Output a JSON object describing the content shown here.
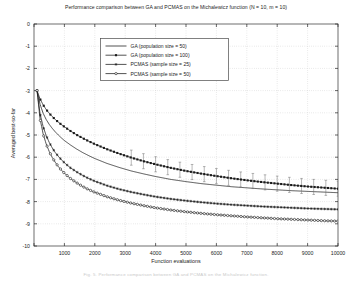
{
  "figure": {
    "title": "Performance comparison between GA and PCMAS on the Michalewicz function (N = 10, m = 10)",
    "xlabel": "Function evaluations",
    "ylabel": "Averaged best-so-far",
    "caption_artifact": "Fig. 5.  Performance comparison between GA and PCMAS on the Michalewicz function."
  },
  "chart_data": {
    "type": "line",
    "title": "Performance comparison between GA and PCMAS on the Michalewicz function (N = 10, m = 10)",
    "xlabel": "Function evaluations",
    "ylabel": "Averaged best-so-far",
    "xlim": [
      0,
      10000
    ],
    "ylim": [
      -10,
      0
    ],
    "xticks": [
      0,
      1000,
      2000,
      3000,
      4000,
      5000,
      6000,
      7000,
      8000,
      9000,
      10000
    ],
    "xticklabels": [
      "",
      "1000",
      "2000",
      "3000",
      "4000",
      "5000",
      "6000",
      "7000",
      "8000",
      "9000",
      "10000"
    ],
    "yticks": [
      0,
      -1,
      -2,
      -3,
      -4,
      -5,
      -6,
      -7,
      -8,
      -9,
      -10
    ],
    "yticklabels": [
      "0",
      "-1",
      "-2",
      "-3",
      "-4",
      "-5",
      "-6",
      "-7",
      "-8",
      "-9",
      "-10"
    ],
    "grid": true,
    "legend_position": "upper-center-left",
    "series": [
      {
        "name": "GA (population size = 50)",
        "marker": "none",
        "color": "#1a1a1a",
        "x": [
          100,
          200,
          300,
          400,
          500,
          600,
          700,
          800,
          900,
          1000,
          1200,
          1400,
          1600,
          1800,
          2000,
          2400,
          2800,
          3200,
          3600,
          4000,
          4500,
          5000,
          5500,
          6000,
          6500,
          7000,
          7500,
          8000,
          8500,
          9000,
          9500,
          10000
        ],
        "values": [
          -3.0,
          -3.62,
          -4.02,
          -4.3,
          -4.52,
          -4.7,
          -4.86,
          -5.0,
          -5.13,
          -5.25,
          -5.45,
          -5.63,
          -5.79,
          -5.93,
          -6.06,
          -6.28,
          -6.46,
          -6.62,
          -6.75,
          -6.87,
          -7.0,
          -7.1,
          -7.19,
          -7.26,
          -7.33,
          -7.38,
          -7.43,
          -7.47,
          -7.51,
          -7.54,
          -7.57,
          -7.6
        ]
      },
      {
        "name": "GA (population size = 100)",
        "marker": "filled-square",
        "color": "#1a1a1a",
        "x": [
          100,
          200,
          300,
          400,
          500,
          600,
          700,
          800,
          900,
          1000,
          1200,
          1400,
          1600,
          1800,
          2000,
          2400,
          2800,
          3200,
          3600,
          4000,
          4500,
          5000,
          5500,
          6000,
          6500,
          7000,
          7500,
          8000,
          8500,
          9000,
          9500,
          10000
        ],
        "values": [
          -3.0,
          -3.38,
          -3.64,
          -3.85,
          -4.02,
          -4.17,
          -4.3,
          -4.42,
          -4.53,
          -4.63,
          -4.82,
          -4.99,
          -5.14,
          -5.28,
          -5.41,
          -5.64,
          -5.84,
          -6.02,
          -6.18,
          -6.32,
          -6.48,
          -6.62,
          -6.74,
          -6.85,
          -6.95,
          -7.04,
          -7.12,
          -7.19,
          -7.26,
          -7.32,
          -7.37,
          -7.42
        ],
        "errorbars": true,
        "errorbar_x": [
          3200,
          3600,
          4000,
          4400,
          4800,
          5200,
          5600,
          6000,
          6400,
          6800,
          7200,
          7600,
          8000,
          8400,
          8800,
          9200,
          9600,
          10000
        ],
        "errorbar_size": 0.34
      },
      {
        "name": "PCMAS (sample size = 25)",
        "marker": "asterisk",
        "color": "#1a1a1a",
        "x": [
          100,
          200,
          300,
          400,
          500,
          600,
          700,
          800,
          900,
          1000,
          1200,
          1400,
          1600,
          1800,
          2000,
          2400,
          2800,
          3200,
          3600,
          4000,
          4500,
          5000,
          5500,
          6000,
          6500,
          7000,
          7500,
          8000,
          8500,
          9000,
          9500,
          10000
        ],
        "values": [
          -3.0,
          -4.05,
          -4.62,
          -5.02,
          -5.33,
          -5.58,
          -5.79,
          -5.96,
          -6.11,
          -6.25,
          -6.48,
          -6.66,
          -6.82,
          -6.96,
          -7.08,
          -7.28,
          -7.44,
          -7.57,
          -7.68,
          -7.78,
          -7.88,
          -7.96,
          -8.03,
          -8.09,
          -8.14,
          -8.18,
          -8.22,
          -8.25,
          -8.28,
          -8.31,
          -8.33,
          -8.35
        ]
      },
      {
        "name": "PCMAS (sample size = 50)",
        "marker": "open-circle",
        "color": "#1a1a1a",
        "x": [
          100,
          200,
          300,
          400,
          500,
          600,
          700,
          800,
          900,
          1000,
          1200,
          1400,
          1600,
          1800,
          2000,
          2400,
          2800,
          3200,
          3600,
          4000,
          4500,
          5000,
          5500,
          6000,
          6500,
          7000,
          7500,
          8000,
          8500,
          9000,
          9500,
          10000
        ],
        "values": [
          -3.0,
          -4.28,
          -4.95,
          -5.4,
          -5.74,
          -6.01,
          -6.23,
          -6.42,
          -6.58,
          -6.72,
          -6.96,
          -7.15,
          -7.32,
          -7.46,
          -7.58,
          -7.78,
          -7.94,
          -8.07,
          -8.18,
          -8.28,
          -8.38,
          -8.46,
          -8.53,
          -8.59,
          -8.64,
          -8.69,
          -8.73,
          -8.77,
          -8.8,
          -8.83,
          -8.86,
          -8.88
        ]
      }
    ],
    "legend": [
      "GA (population size = 50)",
      "GA (population size = 100)",
      "PCMAS (sample size = 25)",
      "PCMAS (sample size = 50)"
    ]
  }
}
